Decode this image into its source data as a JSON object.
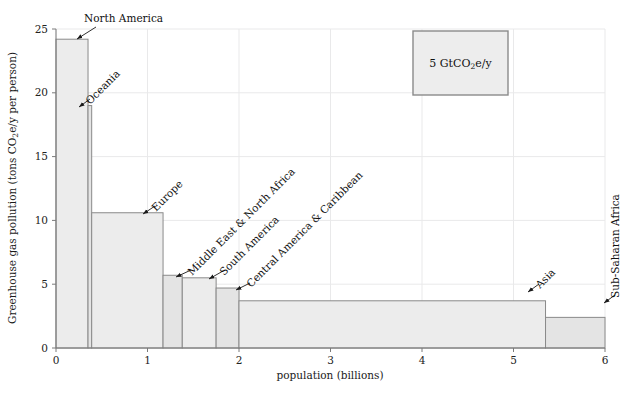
{
  "chart_data": {
    "type": "bar",
    "title": "",
    "xlabel": "population (billions)",
    "ylabel": "Greenhouse gas pollution (tons CO₂e/y per person)",
    "xlim": [
      0,
      6
    ],
    "ylim": [
      0,
      25
    ],
    "xticks": [
      "0",
      "1",
      "2",
      "3",
      "4",
      "5",
      "6"
    ],
    "xtick_values": [
      0,
      1,
      2,
      3,
      4,
      5,
      6
    ],
    "yticks": [
      "0",
      "5",
      "10",
      "15",
      "20",
      "25"
    ],
    "ytick_values": [
      0,
      5,
      10,
      15,
      20,
      25
    ],
    "grid": true,
    "legend_position": "none",
    "note": "Variable-width (Marimekko / population-weighted) bar chart: bar width = population, bar height = per-capita emissions, bar area = total emissions.",
    "bars": [
      {
        "name": "North America",
        "x0": 0.0,
        "x1": 0.35,
        "value": 24.2
      },
      {
        "name": "Oceania",
        "x0": 0.35,
        "x1": 0.39,
        "value": 19.0
      },
      {
        "name": "Europe",
        "x0": 0.39,
        "x1": 1.17,
        "value": 10.6
      },
      {
        "name": "Middle East & North Africa",
        "x0": 1.17,
        "x1": 1.38,
        "value": 5.7
      },
      {
        "name": "South America",
        "x0": 1.38,
        "x1": 1.75,
        "value": 5.5
      },
      {
        "name": "Central America & Caribbean",
        "x0": 1.75,
        "x1": 2.0,
        "value": 4.7
      },
      {
        "name": "Asia",
        "x0": 2.0,
        "x1": 5.35,
        "value": 3.7
      },
      {
        "name": "Sub-Saharan Africa",
        "x0": 5.35,
        "x1": 6.0,
        "value": 2.4
      }
    ],
    "annotations": [
      {
        "label": "North America",
        "rotation": 0,
        "text_x": 84,
        "text_y": 22,
        "anchor": "start",
        "arrow_from_x": 96,
        "arrow_from_y": 27,
        "arrow_to_x": 77,
        "arrow_to_y": 39
      },
      {
        "label": "Oceania",
        "rotation": -45,
        "text_x": 90,
        "text_y": 105,
        "anchor": "start",
        "arrow_from_x": 90,
        "arrow_from_y": 99,
        "arrow_to_x": 79,
        "arrow_to_y": 107
      },
      {
        "label": "Europe",
        "rotation": -45,
        "text_x": 156,
        "text_y": 212,
        "anchor": "start",
        "arrow_from_x": 155,
        "arrow_from_y": 206,
        "arrow_to_x": 143,
        "arrow_to_y": 214
      },
      {
        "label": "Middle East & North Africa",
        "rotation": -45,
        "text_x": 192,
        "text_y": 276,
        "anchor": "start",
        "arrow_from_x": 191,
        "arrow_from_y": 270,
        "arrow_to_x": 176,
        "arrow_to_y": 277
      },
      {
        "label": "South America",
        "rotation": -45,
        "text_x": 224,
        "text_y": 276,
        "anchor": "start",
        "arrow_from_x": 223,
        "arrow_from_y": 271,
        "arrow_to_x": 209,
        "arrow_to_y": 279
      },
      {
        "label": "Central America & Caribbean",
        "rotation": -45,
        "text_x": 251,
        "text_y": 288,
        "anchor": "start",
        "arrow_from_x": 250,
        "arrow_from_y": 283,
        "arrow_to_x": 236,
        "arrow_to_y": 290
      },
      {
        "label": "Asia",
        "rotation": -45,
        "text_x": 540,
        "text_y": 289,
        "anchor": "start",
        "arrow_from_x": 539,
        "arrow_from_y": 284,
        "arrow_to_x": 528,
        "arrow_to_y": 292
      },
      {
        "label": "Sub-Saharan Africa",
        "rotation": -90,
        "text_x": 619,
        "text_y": 298,
        "anchor": "start",
        "arrow_from_x": 615,
        "arrow_from_y": 295,
        "arrow_to_x": 604,
        "arrow_to_y": 303
      }
    ],
    "legend_key": {
      "label_prefix": "5 GtCO",
      "label_sub": "2",
      "label_suffix": "e/y",
      "label_full": "5 GtCO₂e/y",
      "x": 413,
      "y": 31,
      "width": 95,
      "height": 64,
      "area_value_gt": 5,
      "fill_color": "#ededed",
      "stroke_color": "#8a8a8a"
    },
    "colors": {
      "bar_fill": "#ececec",
      "bar_fill_alt": "#e4e4e4",
      "bar_stroke": "#8a8a8a",
      "grid": "#e9e9ea",
      "axis": "#7b7b7b",
      "text": "#1a1a1a",
      "background": "#ffffff"
    }
  }
}
